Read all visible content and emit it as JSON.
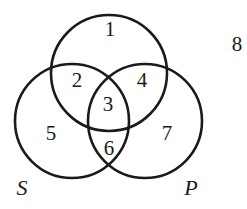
{
  "diagram": {
    "type": "venn",
    "circles": [
      {
        "id": "top",
        "label": ""
      },
      {
        "id": "S",
        "label": "S"
      },
      {
        "id": "P",
        "label": "P"
      }
    ],
    "regions": [
      {
        "id": 1,
        "label": "1"
      },
      {
        "id": 2,
        "label": "2"
      },
      {
        "id": 3,
        "label": "3"
      },
      {
        "id": 4,
        "label": "4"
      },
      {
        "id": 5,
        "label": "5"
      },
      {
        "id": 6,
        "label": "6"
      },
      {
        "id": 7,
        "label": "7"
      },
      {
        "id": 8,
        "label": "8"
      }
    ],
    "stroke_color": "#1a1a1a"
  }
}
